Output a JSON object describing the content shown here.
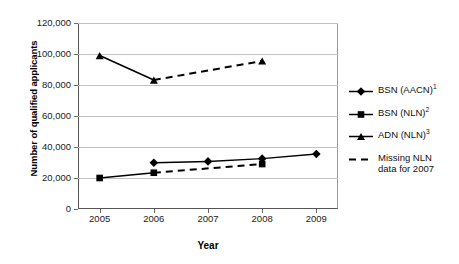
{
  "chart_data": {
    "type": "line",
    "title": "",
    "xlabel": "Year",
    "ylabel": "Number of qualified applicants",
    "categories": [
      2005,
      2006,
      2007,
      2008,
      2009
    ],
    "x": [
      "2005",
      "2006",
      "2007",
      "2008",
      "2009"
    ],
    "xlim": [
      2004.6,
      2009.4
    ],
    "ylim": [
      0,
      120000
    ],
    "ytick_labels": [
      "0",
      "20,000",
      "40,000",
      "60,000",
      "80,000",
      "100,000",
      "120,000"
    ],
    "ytick_values": [
      0,
      20000,
      40000,
      60000,
      80000,
      100000,
      120000
    ],
    "grid": "horizontal",
    "legend_position": "right",
    "series": [
      {
        "name": "BSN (AACN)",
        "footnote": "1",
        "marker": "diamond",
        "linestyle": "solid",
        "color": "#000000",
        "x": [
          2006,
          2007,
          2008,
          2009
        ],
        "values": [
          29800,
          30700,
          32500,
          35500
        ]
      },
      {
        "name": "BSN (NLN)",
        "footnote": "2",
        "marker": "square",
        "linestyle": "solid-then-dashed",
        "color": "#000000",
        "x": [
          2005,
          2006,
          2008
        ],
        "values": [
          20000,
          23400,
          29000
        ]
      },
      {
        "name": "ADN (NLN)",
        "footnote": "3",
        "marker": "triangle",
        "linestyle": "solid-then-dashed",
        "color": "#000000",
        "x": [
          2005,
          2006,
          2008
        ],
        "values": [
          99000,
          83200,
          95500
        ]
      }
    ],
    "missing_data_note": {
      "marker": "dashed-line",
      "label_line1": "Missing NLN",
      "label_line2": "data for 2007"
    }
  },
  "legend": {
    "items": [
      {
        "label": "BSN (AACN)",
        "sup": "1",
        "key": "diamond-marker-icon"
      },
      {
        "label": "BSN (NLN)",
        "sup": "2",
        "key": "square-marker-icon"
      },
      {
        "label": "ADN (NLN)",
        "sup": "3",
        "key": "triangle-marker-icon"
      },
      {
        "label": "Missing NLN\ndata for 2007",
        "sup": "",
        "key": "dashed-line-icon"
      }
    ]
  }
}
